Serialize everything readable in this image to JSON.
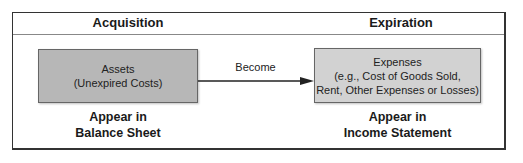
{
  "diagram": {
    "columns": {
      "left": {
        "header": "Acquisition",
        "box": {
          "line1": "Assets",
          "line2": "(Unexpired Costs)"
        },
        "footer": {
          "line1": "Appear in",
          "line2": "Balance Sheet"
        }
      },
      "right": {
        "header": "Expiration",
        "box": {
          "line1": "Expenses",
          "line2": "(e.g., Cost of Goods Sold,",
          "line3": "Rent, Other Expenses or Losses)"
        },
        "footer": {
          "line1": "Appear in",
          "line2": "Income Statement"
        }
      }
    },
    "arrow": {
      "label": "Become"
    },
    "colors": {
      "assets_fill": "#b7b7b7",
      "expenses_fill": "#d2d2d2",
      "border": "#333333"
    }
  }
}
